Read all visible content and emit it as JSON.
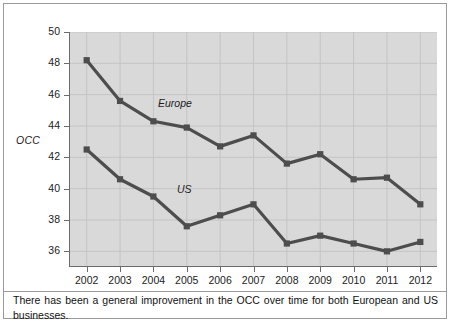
{
  "chart_data": {
    "type": "line",
    "title": "",
    "xlabel": "",
    "ylabel": "OCC",
    "categories": [
      "2002",
      "2003",
      "2004",
      "2005",
      "2006",
      "2007",
      "2008",
      "2009",
      "2010",
      "2011",
      "2012"
    ],
    "x": [
      2002,
      2003,
      2004,
      2005,
      2006,
      2007,
      2008,
      2009,
      2010,
      2011,
      2012
    ],
    "ylim": [
      35,
      50
    ],
    "yticks": [
      36,
      38,
      40,
      42,
      44,
      46,
      48,
      50
    ],
    "ytick_labels": [
      "36",
      "38",
      "40",
      "42",
      "44",
      "46",
      "48",
      "50"
    ],
    "grid": true,
    "legend_position": "inline-annotation",
    "series": [
      {
        "name": "Europe",
        "color": "#4d4d4d",
        "values": [
          48.2,
          45.6,
          44.3,
          43.9,
          42.7,
          43.4,
          41.6,
          42.2,
          40.6,
          40.7,
          39.0
        ]
      },
      {
        "name": "US",
        "color": "#4d4d4d",
        "values": [
          42.5,
          40.6,
          39.5,
          37.6,
          38.3,
          39.0,
          36.5,
          37.0,
          36.5,
          36.0,
          36.6
        ]
      }
    ],
    "annotations": [
      {
        "text": "Europe",
        "series": "Europe"
      },
      {
        "text": "US",
        "series": "US"
      }
    ]
  },
  "caption": {
    "text": "There has been a general improvement in the OCC over time for both European and US businesses."
  },
  "colors": {
    "plot_background": "#d9d9d9",
    "gridline": "#c4c4c4",
    "axis": "#6b6b6b",
    "series_line": "#4d4d4d",
    "frame": "#9a9a9a",
    "text": "#1c1c1c"
  }
}
